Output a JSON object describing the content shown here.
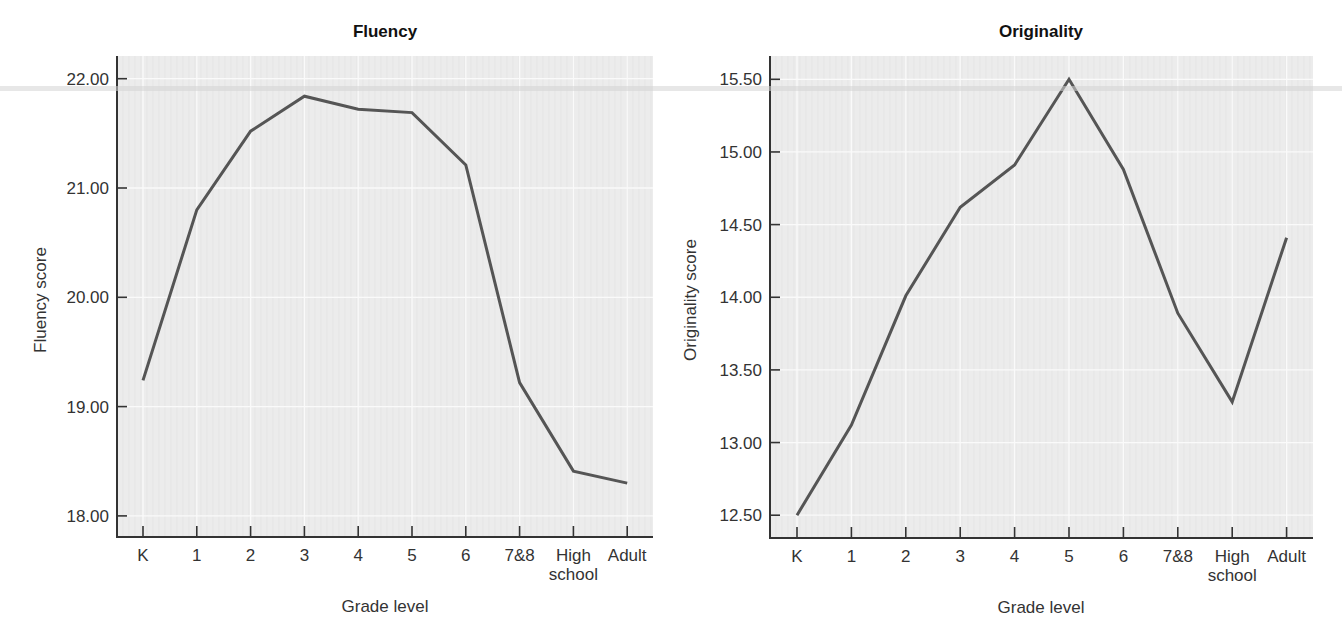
{
  "chart_data": [
    {
      "type": "line",
      "title": "Fluency",
      "xlabel": "Grade level",
      "ylabel": "Fluency score",
      "categories": [
        "K",
        "1",
        "2",
        "3",
        "4",
        "5",
        "6",
        "7&8",
        "High school",
        "Adult"
      ],
      "category_lines": [
        [
          "K"
        ],
        [
          "1"
        ],
        [
          "2"
        ],
        [
          "3"
        ],
        [
          "4"
        ],
        [
          "5"
        ],
        [
          "6"
        ],
        [
          "7&8"
        ],
        [
          "High",
          "school"
        ],
        [
          "Adult"
        ]
      ],
      "values": [
        19.24,
        20.8,
        21.52,
        21.84,
        21.72,
        21.69,
        21.21,
        19.22,
        18.41,
        18.3
      ],
      "yticks": [
        18.0,
        19.0,
        20.0,
        21.0,
        22.0
      ],
      "ytick_labels": [
        "18.00",
        "19.00",
        "20.00",
        "21.00",
        "22.00"
      ],
      "ylim": [
        17.8,
        22.2
      ],
      "grid": true,
      "legend": null
    },
    {
      "type": "line",
      "title": "Originality",
      "xlabel": "Grade level",
      "ylabel": "Originality score",
      "categories": [
        "K",
        "1",
        "2",
        "3",
        "4",
        "5",
        "6",
        "7&8",
        "High school",
        "Adult"
      ],
      "category_lines": [
        [
          "K"
        ],
        [
          "1"
        ],
        [
          "2"
        ],
        [
          "3"
        ],
        [
          "4"
        ],
        [
          "5"
        ],
        [
          "6"
        ],
        [
          "7&8"
        ],
        [
          "High",
          "school"
        ],
        [
          "Adult"
        ]
      ],
      "values": [
        12.5,
        13.12,
        14.01,
        14.62,
        14.91,
        15.5,
        14.88,
        13.89,
        13.28,
        14.41
      ],
      "yticks": [
        12.5,
        13.0,
        13.5,
        14.0,
        14.5,
        15.0,
        15.5
      ],
      "ytick_labels": [
        "12.50",
        "13.00",
        "13.50",
        "14.00",
        "14.50",
        "15.00",
        "15.50"
      ],
      "ylim": [
        12.34,
        15.66
      ],
      "grid": true,
      "legend": null
    }
  ],
  "colors": {
    "line": "#555555",
    "plot_background": "#ececec",
    "gridline": "#fafafa",
    "axis": "#333333"
  }
}
